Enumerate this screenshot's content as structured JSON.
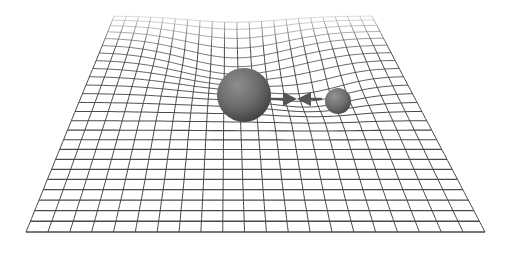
{
  "diagram": {
    "title": "",
    "background": "#ffffff",
    "grid": {
      "color": "#4a4a4a",
      "columns": 21,
      "rows": 25,
      "top_left": [
        114,
        16
      ],
      "top_right": [
        372,
        16
      ],
      "bottom_left": [
        26,
        232
      ],
      "bottom_right": [
        485,
        232
      ]
    },
    "masses": [
      {
        "name": "large-mass",
        "cx": 244,
        "cy": 95,
        "r": 27,
        "color": "#6a6a6a"
      },
      {
        "name": "small-mass",
        "cx": 338,
        "cy": 101,
        "r": 13,
        "color": "#6f6f6f"
      }
    ],
    "arrows": [
      {
        "name": "force-arrow-right",
        "from": [
          270,
          99
        ],
        "to": [
          290,
          99
        ],
        "color": "#555555"
      },
      {
        "name": "force-arrow-left",
        "from": [
          322,
          99
        ],
        "to": [
          304,
          99
        ],
        "color": "#555555"
      }
    ]
  }
}
